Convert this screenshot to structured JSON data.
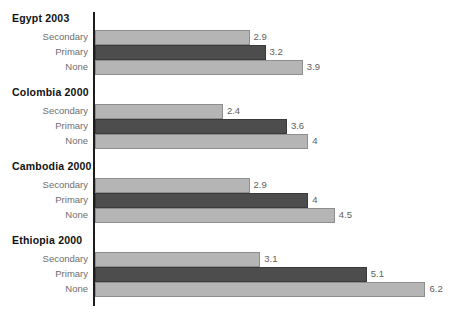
{
  "chart_data": {
    "type": "bar",
    "orientation": "horizontal",
    "title": "",
    "subtitle": "",
    "xlabel": "",
    "ylabel": "",
    "xlim": [
      0,
      6.2
    ],
    "grid": false,
    "legend": false,
    "legend_position": "none",
    "categories": [
      "Secondary",
      "Primary",
      "None"
    ],
    "groups": [
      {
        "name": "Egypt 2003",
        "bars": [
          {
            "label": "Secondary",
            "value": 2.9,
            "value_text": "2.9",
            "style": "light"
          },
          {
            "label": "Primary",
            "value": 3.2,
            "value_text": "3.2",
            "style": "dark"
          },
          {
            "label": "None",
            "value": 3.9,
            "value_text": "3.9",
            "style": "light"
          }
        ]
      },
      {
        "name": "Colombia 2000",
        "bars": [
          {
            "label": "Secondary",
            "value": 2.4,
            "value_text": "2.4",
            "style": "light"
          },
          {
            "label": "Primary",
            "value": 3.6,
            "value_text": "3.6",
            "style": "dark"
          },
          {
            "label": "None",
            "value": 4.0,
            "value_text": "4",
            "style": "light"
          }
        ]
      },
      {
        "name": "Cambodia 2000",
        "bars": [
          {
            "label": "Secondary",
            "value": 2.9,
            "value_text": "2.9",
            "style": "light"
          },
          {
            "label": "Primary",
            "value": 4.0,
            "value_text": "4",
            "style": "dark"
          },
          {
            "label": "None",
            "value": 4.5,
            "value_text": "4.5",
            "style": "light"
          }
        ]
      },
      {
        "name": "Ethiopia 2000",
        "bars": [
          {
            "label": "Secondary",
            "value": 3.1,
            "value_text": "3.1",
            "style": "light"
          },
          {
            "label": "Primary",
            "value": 5.1,
            "value_text": "5.1",
            "style": "dark"
          },
          {
            "label": "None",
            "value": 6.2,
            "value_text": "6.2",
            "style": "light"
          }
        ]
      }
    ]
  },
  "colors": {
    "light_bar_fill": "#b5b5b5",
    "light_bar_border": "#8e8e8e",
    "dark_bar_fill": "#4d4d4d",
    "dark_bar_border": "#3a3a3a",
    "axis": "#1b1b1b",
    "group_title_text": "#111111",
    "category_label_text": "#6e6e6e",
    "value_label_text": "#5e5e5e",
    "background": "#ffffff"
  }
}
